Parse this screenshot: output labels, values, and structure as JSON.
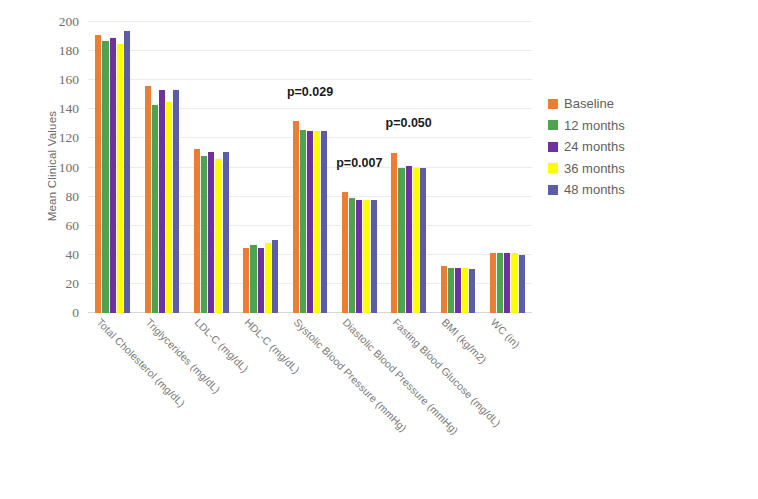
{
  "chart_data": {
    "type": "bar",
    "title": "",
    "subtitle": "",
    "xlabel": "",
    "ylabel": "Mean Clinical Values",
    "ylim": [
      0,
      200
    ],
    "ytick_step": 20,
    "yticks": [
      0,
      20,
      40,
      60,
      80,
      100,
      120,
      140,
      160,
      180,
      200
    ],
    "grid": true,
    "grid_axis": "y",
    "legend_position": "right",
    "categories": [
      "Total Cholesterol (mg/dL)",
      "Triglycerides (mg/dL)",
      "LDL-C (mg/dL)",
      "HDL-C (mg/dL)",
      "Systolic Blood Pressure (mmHg)",
      "Diastolic Blood Pressure (mmHg)",
      "Fasting Blood Glucose (mg/dL)",
      "BMI (kg/m2)",
      "WC (in)"
    ],
    "series": [
      {
        "name": "Baseline",
        "color": "#ed7d31",
        "values": [
          191,
          156,
          113,
          45,
          132,
          83,
          110,
          32,
          41
        ]
      },
      {
        "name": "12 months",
        "color": "#4ea34e",
        "values": [
          187,
          143,
          108,
          47,
          126,
          79,
          100,
          31,
          41
        ]
      },
      {
        "name": "24 months",
        "color": "#7030a0",
        "values": [
          189,
          153,
          111,
          45,
          125,
          78,
          101,
          31,
          41
        ]
      },
      {
        "name": "36 months",
        "color": "#ffff00",
        "values": [
          185,
          145,
          106,
          48,
          125,
          78,
          100,
          31,
          41
        ]
      },
      {
        "name": "48 months",
        "color": "#5b5ea6",
        "values": [
          194,
          153,
          111,
          50,
          125,
          78,
          100,
          30,
          40
        ]
      }
    ],
    "annotations": [
      {
        "text": "p=0.029",
        "category": "Systolic Blood Pressure (mmHg)",
        "category_index": 4,
        "y": 147
      },
      {
        "text": "p=0.007",
        "category": "Diastolic Blood Pressure (mmHg)",
        "category_index": 5,
        "y": 98
      },
      {
        "text": "p=0.050",
        "category": "Fasting Blood Glucose (mg/dL)",
        "category_index": 6,
        "y": 126
      }
    ]
  }
}
